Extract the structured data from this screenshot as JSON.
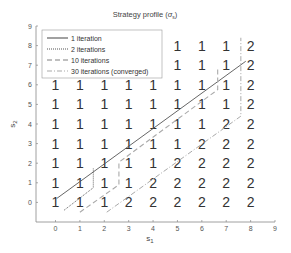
{
  "chart_data": {
    "type": "line",
    "title": "Strategy profile (σs)",
    "title_text": "Strategy profile (",
    "title_symbol": "σ",
    "title_sub": "s",
    "title_close": ")",
    "xlabel": "s",
    "xlabel_sub": "1",
    "ylabel": "s",
    "ylabel_sub": "2",
    "xlim": [
      -0.8,
      9
    ],
    "ylim": [
      -1,
      9
    ],
    "xticks": [
      0,
      1,
      2,
      3,
      4,
      5,
      6,
      7,
      8,
      9
    ],
    "yticks": [
      0,
      1,
      2,
      3,
      4,
      5,
      6,
      7,
      8,
      9
    ],
    "grid": false,
    "legend_position": "upper left",
    "legend": [
      {
        "label": "1 iteration",
        "style": "solid"
      },
      {
        "label": "2 iterations",
        "style": "dotted"
      },
      {
        "label": "10 iterations",
        "style": "dashed"
      },
      {
        "label": "30 iterations (converged)",
        "style": "dashdot"
      }
    ],
    "series": [
      {
        "name": "1 iteration",
        "style": "solid",
        "points": [
          [
            0.05,
            0.2
          ],
          [
            7.8,
            7.2
          ]
        ]
      },
      {
        "name": "2 iterations",
        "style": "dotted",
        "points": [
          [
            0.35,
            -0.4
          ],
          [
            1.55,
            0.75
          ],
          [
            1.55,
            1.75
          ]
        ]
      },
      {
        "name": "10 iterations",
        "style": "dashed",
        "points": [
          [
            1.0,
            -0.5
          ],
          [
            2.6,
            0.9
          ],
          [
            2.6,
            2.05
          ],
          [
            6.65,
            5.75
          ],
          [
            6.65,
            6.9
          ]
        ]
      },
      {
        "name": "30 iterations (converged)",
        "style": "dashdot",
        "points": [
          [
            2.1,
            -0.5
          ],
          [
            7.6,
            4.4
          ],
          [
            7.6,
            8.4
          ]
        ]
      }
    ],
    "grid_labels": {
      "description": "Best-response label (1 or 2) shown at integer (s1, s2) cells; null = hidden by legend",
      "s1": [
        0,
        1,
        2,
        3,
        4,
        5,
        6,
        7,
        8
      ],
      "rows": [
        {
          "s2": 8,
          "values": [
            null,
            null,
            null,
            null,
            null,
            1,
            1,
            1,
            2
          ]
        },
        {
          "s2": 7,
          "values": [
            null,
            null,
            null,
            null,
            null,
            1,
            1,
            1,
            2
          ]
        },
        {
          "s2": 6,
          "values": [
            1,
            1,
            1,
            1,
            1,
            1,
            1,
            1,
            2
          ]
        },
        {
          "s2": 5,
          "values": [
            1,
            1,
            1,
            1,
            1,
            1,
            1,
            1,
            2
          ]
        },
        {
          "s2": 4,
          "values": [
            1,
            1,
            1,
            1,
            1,
            1,
            1,
            2,
            2
          ]
        },
        {
          "s2": 3,
          "values": [
            1,
            1,
            1,
            1,
            1,
            1,
            2,
            2,
            2
          ]
        },
        {
          "s2": 2,
          "values": [
            1,
            1,
            1,
            1,
            1,
            2,
            2,
            2,
            2
          ]
        },
        {
          "s2": 1,
          "values": [
            1,
            1,
            1,
            1,
            2,
            2,
            2,
            2,
            2
          ]
        },
        {
          "s2": 0,
          "values": [
            1,
            1,
            1,
            2,
            2,
            2,
            2,
            2,
            2
          ]
        }
      ]
    }
  },
  "colors": {
    "axis": "#888888",
    "line": "#555555",
    "dashed_line": "#aaaaaa",
    "text": "#333333"
  }
}
